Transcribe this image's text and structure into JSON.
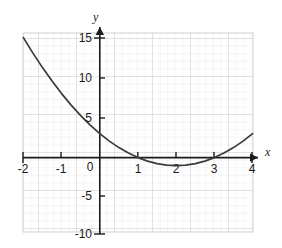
{
  "chart_data": {
    "type": "line",
    "title": "",
    "subtitle": "",
    "xlabel": "x",
    "ylabel": "y",
    "equation": "y = x^2 - 4x + 3",
    "xlim": [
      -2,
      4
    ],
    "ylim": [
      -10,
      15
    ],
    "grid": true,
    "grid_major_step_x": 1,
    "grid_major_step_y": 5,
    "grid_minor_per_major_x": 5,
    "grid_minor_per_major_y": 5,
    "legend": null,
    "legend_position": "none",
    "x_ticks": [
      -2,
      -1,
      0,
      1,
      2,
      3,
      4
    ],
    "x_tick_labels": [
      "-2",
      "-1",
      "0",
      "1",
      "2",
      "3",
      "4"
    ],
    "y_ticks": [
      15,
      10,
      5,
      -5,
      -10
    ],
    "y_tick_labels": [
      "15",
      "10",
      "5",
      "-5",
      "-10"
    ],
    "origin_label": "0",
    "series": [
      {
        "name": "parabola",
        "type": "line",
        "color": "#3a3a3a",
        "x": [
          -2,
          -1.75,
          -1.5,
          -1.25,
          -1,
          -0.75,
          -0.5,
          -0.25,
          0,
          0.25,
          0.5,
          0.75,
          1,
          1.25,
          1.5,
          1.75,
          2,
          2.25,
          2.5,
          2.75,
          3,
          3.25,
          3.5,
          3.75,
          4
        ],
        "values": [
          15,
          13.0625,
          11.25,
          9.5625,
          8,
          6.5625,
          5.25,
          4.0625,
          3,
          2.0625,
          1.25,
          0.5625,
          0,
          -0.4375,
          -0.75,
          -0.9375,
          -1,
          -0.9375,
          -0.75,
          -0.4375,
          0,
          0.5625,
          1.25,
          2.0625,
          3
        ]
      }
    ],
    "roots": [
      1,
      3
    ],
    "vertex": [
      2,
      -1
    ],
    "y_intercept": 3
  },
  "colors": {
    "axis": "#1a1a1a",
    "curve": "#3a3a3a",
    "grid_major": "#c9c9cf",
    "grid_minor": "#e6e6ea",
    "background": "#ffffff",
    "text": "#1a1a1a"
  }
}
